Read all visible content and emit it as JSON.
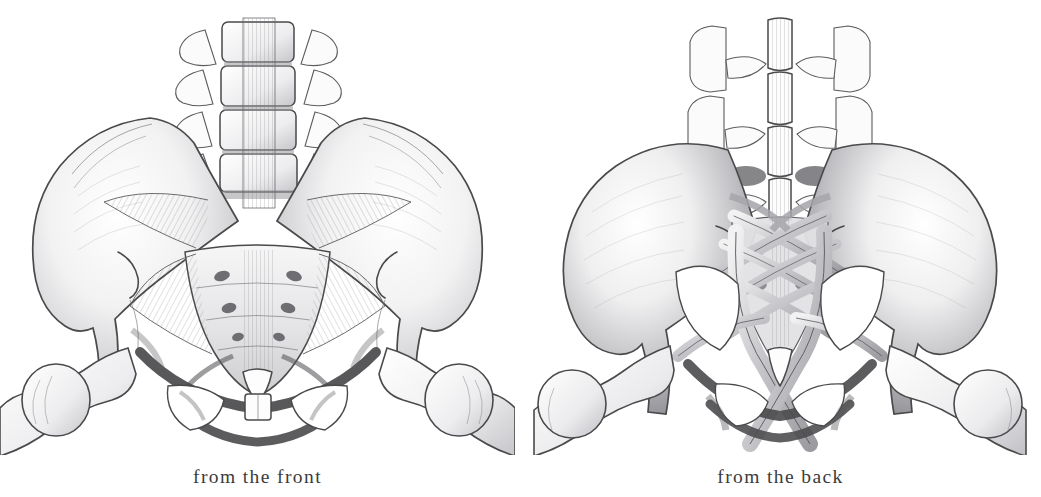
{
  "page": {
    "background_color": "#ffffff",
    "ink_color": "#4a4a4c",
    "caption_color": "#3b3b3d",
    "medium": "graphite pencil drawing"
  },
  "figures": [
    {
      "id": "fig-front",
      "view": "anterior",
      "caption": "from the front",
      "structures": [
        "lumbar vertebrae",
        "anterior longitudinal ligament",
        "iliac crest",
        "ilium",
        "iliolumbar ligament",
        "anterior sacroiliac ligament",
        "sacrum",
        "anterior sacral foramina",
        "acetabulum",
        "obturator foramen",
        "superior pubic ramus",
        "pubic symphysis",
        "femoral head",
        "greater trochanter"
      ]
    },
    {
      "id": "fig-back",
      "view": "posterior",
      "caption": "from the back",
      "structures": [
        "lumbar vertebrae",
        "spinous processes",
        "supraspinous ligament",
        "iliac crest",
        "posterior superior iliac spine",
        "posterior sacroiliac ligaments",
        "sacrotuberous ligament",
        "sacrospinous ligament",
        "posterior sacral foramina",
        "coccyx",
        "ischial tuberosity",
        "greater trochanter",
        "femoral neck"
      ]
    }
  ],
  "captions": {
    "front": "from the front",
    "back": "from the back"
  }
}
